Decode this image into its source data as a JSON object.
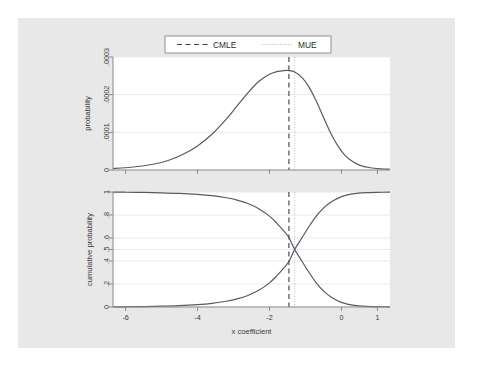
{
  "figure": {
    "background_color": "#e8e8e8",
    "panel_color": "#ffffff",
    "curve_color": "#555a66",
    "grid_color": "#eaeaea",
    "axis_color": "#8a8a8a"
  },
  "legend": {
    "items": [
      {
        "label": "CMLE",
        "style": "dashed",
        "color": "#3c3c3c"
      },
      {
        "label": "MUE",
        "style": "dotted",
        "color": "#b8b8b8"
      }
    ]
  },
  "chart_data": [
    {
      "type": "line",
      "panel": "top",
      "title": "",
      "xlabel": "",
      "ylabel": "probability",
      "xlim": [
        -6.35,
        1.35
      ],
      "ylim": [
        0,
        0.0003
      ],
      "grid": true,
      "legend_position": "top-center",
      "xticks": [
        -6,
        -4,
        -2,
        0,
        1
      ],
      "xtick_labels": [
        "-6",
        "-4",
        "-2",
        "0",
        "1"
      ],
      "yticks": [
        0,
        0.0001,
        0.0002,
        0.0003
      ],
      "ytick_labels": [
        "0",
        ".0001",
        ".0002",
        ".0003"
      ],
      "series": [
        {
          "name": "probability density",
          "x": [
            -6.35,
            -6.0,
            -5.6,
            -5.2,
            -4.8,
            -4.4,
            -4.0,
            -3.6,
            -3.2,
            -2.9,
            -2.6,
            -2.3,
            -2.0,
            -1.8,
            -1.6,
            -1.46,
            -1.3,
            -1.1,
            -0.9,
            -0.7,
            -0.5,
            -0.3,
            -0.1,
            0.1,
            0.3,
            0.5,
            0.8,
            1.1,
            1.35
          ],
          "y": [
            4e-06,
            6e-06,
            1e-05,
            1.6e-05,
            2.6e-05,
            4.2e-05,
            6.4e-05,
            9.5e-05,
            0.000135,
            0.00017,
            0.000205,
            0.000235,
            0.000254,
            0.000261,
            0.000264,
            0.000264,
            0.00026,
            0.000246,
            0.00022,
            0.000183,
            0.00014,
            9.8e-05,
            6.4e-05,
            3.9e-05,
            2.3e-05,
            1.3e-05,
            6e-06,
            3e-06,
            2e-06
          ]
        }
      ],
      "reference_lines": [
        {
          "name": "CMLE",
          "x": -1.46,
          "style": "dashed",
          "color": "#3c3c3c"
        },
        {
          "name": "MUE",
          "x": -1.3,
          "style": "dotted",
          "color": "#b8b8b8"
        }
      ]
    },
    {
      "type": "line",
      "panel": "bottom",
      "title": "",
      "xlabel": "x coefficient",
      "ylabel": "cumulative probability",
      "xlim": [
        -6.35,
        1.35
      ],
      "ylim": [
        0,
        1
      ],
      "grid": true,
      "xticks": [
        -6,
        -4,
        -2,
        0,
        1
      ],
      "xtick_labels": [
        "-6",
        "-4",
        "-2",
        "0",
        "1"
      ],
      "yticks": [
        0,
        0.2,
        0.4,
        0.5,
        0.6,
        0.8,
        1
      ],
      "ytick_labels": [
        "0",
        ".2",
        ".4",
        ".5",
        ".6",
        ".8",
        "1"
      ],
      "series": [
        {
          "name": "upper cumulative probability",
          "x": [
            -6.35,
            -6.0,
            -5.5,
            -5.0,
            -4.5,
            -4.0,
            -3.6,
            -3.2,
            -2.9,
            -2.6,
            -2.3,
            -2.0,
            -1.8,
            -1.6,
            -1.46,
            -1.3,
            -1.1,
            -0.9,
            -0.7,
            -0.5,
            -0.3,
            0.0,
            0.3,
            0.7,
            1.1,
            1.35
          ],
          "y": [
            0.999,
            0.998,
            0.996,
            0.993,
            0.988,
            0.979,
            0.968,
            0.95,
            0.93,
            0.9,
            0.855,
            0.79,
            0.73,
            0.66,
            0.605,
            0.5,
            0.4,
            0.3,
            0.21,
            0.14,
            0.09,
            0.04,
            0.016,
            0.005,
            0.002,
            0.001
          ]
        },
        {
          "name": "lower cumulative probability",
          "x": [
            -6.35,
            -6.0,
            -5.5,
            -5.0,
            -4.5,
            -4.0,
            -3.6,
            -3.2,
            -2.9,
            -2.6,
            -2.3,
            -2.0,
            -1.8,
            -1.6,
            -1.46,
            -1.3,
            -1.1,
            -0.9,
            -0.7,
            -0.5,
            -0.3,
            0.0,
            0.3,
            0.7,
            1.1,
            1.35
          ],
          "y": [
            0.001,
            0.002,
            0.004,
            0.007,
            0.012,
            0.021,
            0.032,
            0.05,
            0.07,
            0.1,
            0.145,
            0.21,
            0.27,
            0.34,
            0.395,
            0.5,
            0.6,
            0.7,
            0.79,
            0.86,
            0.91,
            0.96,
            0.984,
            0.995,
            0.998,
            0.999
          ]
        }
      ],
      "reference_lines": [
        {
          "name": "CMLE",
          "x": -1.46,
          "style": "dashed",
          "color": "#3c3c3c"
        },
        {
          "name": "MUE",
          "x": -1.3,
          "style": "dotted",
          "color": "#b8b8b8"
        }
      ]
    }
  ]
}
